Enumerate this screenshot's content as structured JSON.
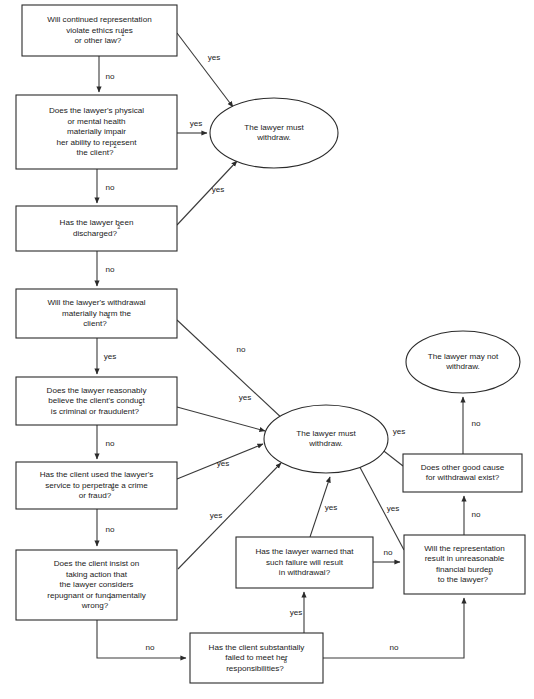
{
  "diagram": {
    "colors": {
      "background": "#ffffff",
      "stroke": "#2b2b2b",
      "edge": "#3a3a3a",
      "text": "#1a1a1a"
    },
    "nodes": [
      {
        "id": "q1",
        "shape": "rect",
        "x": 22,
        "y": 5,
        "w": 155,
        "h": 51,
        "lines": [
          "Will continued representation",
          "violate ethics rules",
          "or other law?"
        ],
        "superscript": "1"
      },
      {
        "id": "q2",
        "shape": "rect",
        "x": 16,
        "y": 95,
        "w": 161,
        "h": 74,
        "lines": [
          "Does the lawyer's physical",
          "or mental health",
          "materially impair",
          "her ability to represent",
          "the client?"
        ],
        "superscript": "2"
      },
      {
        "id": "q3",
        "shape": "rect",
        "x": 16,
        "y": 206,
        "w": 161,
        "h": 45,
        "lines": [
          "Has the lawyer been",
          "discharged?"
        ],
        "superscript": "3"
      },
      {
        "id": "q4",
        "shape": "rect",
        "x": 16,
        "y": 289,
        "w": 161,
        "h": 49,
        "lines": [
          "Will the lawyer's withdrawal",
          "materially harm the",
          "client?"
        ],
        "superscript": "4"
      },
      {
        "id": "q5",
        "shape": "rect",
        "x": 16,
        "y": 377,
        "w": 161,
        "h": 48,
        "lines": [
          "Does the lawyer reasonably",
          "believe the client's conduct",
          "is criminal or fraudulent?"
        ],
        "superscript": "5"
      },
      {
        "id": "q6",
        "shape": "rect",
        "x": 16,
        "y": 462,
        "w": 161,
        "h": 47,
        "lines": [
          "Has the client used the lawyer's",
          "service to perpetrate a crime",
          "or fraud?"
        ],
        "superscript": "6"
      },
      {
        "id": "q7",
        "shape": "rect",
        "x": 16,
        "y": 550,
        "w": 161,
        "h": 70,
        "lines": [
          "Does the client insist on",
          "taking action that",
          "the lawyer considers",
          "repugnant or fundamentally",
          "wrong?"
        ],
        "superscript": "7"
      },
      {
        "id": "q8",
        "shape": "rect",
        "x": 190,
        "y": 633,
        "w": 133,
        "h": 50,
        "lines": [
          "Has the client substantially",
          "failed to meet her",
          "responsibilities?"
        ],
        "superscript": "8"
      },
      {
        "id": "q9",
        "shape": "rect",
        "x": 236,
        "y": 537,
        "w": 137,
        "h": 51,
        "lines": [
          "Has the lawyer warned that",
          "such failure will result",
          "in withdrawal?"
        ],
        "superscript": ""
      },
      {
        "id": "q10",
        "shape": "rect",
        "x": 404,
        "y": 535,
        "w": 121,
        "h": 59,
        "lines": [
          "Will the representation",
          "result in unreasonable",
          "financial burden",
          "to the lawyer?"
        ],
        "superscript": "9"
      },
      {
        "id": "q11",
        "shape": "rect",
        "x": 403,
        "y": 454,
        "w": 119,
        "h": 38,
        "lines": [
          "Does other good cause",
          "for withdrawal exist?"
        ],
        "superscript": ""
      },
      {
        "id": "must1",
        "shape": "ellipse",
        "cx": 274,
        "cy": 133,
        "rx": 64,
        "ry": 35,
        "lines": [
          "The lawyer must",
          "withdraw."
        ],
        "superscript": ""
      },
      {
        "id": "must2",
        "shape": "ellipse",
        "cx": 326,
        "cy": 439,
        "rx": 62,
        "ry": 34,
        "lines": [
          "The lawyer must",
          "withdraw."
        ],
        "superscript": ""
      },
      {
        "id": "maynot",
        "shape": "ellipse",
        "cx": 463,
        "cy": 362,
        "rx": 57,
        "ry": 31,
        "lines": [
          "The lawyer may not",
          "withdraw."
        ],
        "superscript": ""
      }
    ],
    "edges": [
      {
        "id": "e-q1-yes",
        "label": "yes",
        "label_x": 214,
        "label_y": 58,
        "path": "M 177 33 L 233 107",
        "arrow": true
      },
      {
        "id": "e-q1-no",
        "label": "no",
        "label_x": 110,
        "label_y": 77,
        "path": "M 99 56 L 99 92",
        "arrow": true
      },
      {
        "id": "e-q2-yes",
        "label": "yes",
        "label_x": 196,
        "label_y": 124,
        "path": "M 177 133 L 207 133",
        "arrow": true
      },
      {
        "id": "e-q2-no",
        "label": "no",
        "label_x": 110,
        "label_y": 188,
        "path": "M 97 169 L 97 203",
        "arrow": true
      },
      {
        "id": "e-q3-yes",
        "label": "yes",
        "label_x": 218,
        "label_y": 190,
        "path": "M 177 225 L 237 161",
        "arrow": true
      },
      {
        "id": "e-q3-no",
        "label": "no",
        "label_x": 110,
        "label_y": 270,
        "path": "M 97 251 L 97 286",
        "arrow": true
      },
      {
        "id": "e-q4-no",
        "label": "no",
        "label_x": 241,
        "label_y": 350,
        "path": "M 177 320 L 285 421",
        "arrow": true
      },
      {
        "id": "e-q4-yes",
        "label": "yes",
        "label_x": 110,
        "label_y": 357,
        "path": "M 97 338 L 97 374",
        "arrow": true
      },
      {
        "id": "e-q5-yes",
        "label": "yes",
        "label_x": 245,
        "label_y": 398,
        "path": "M 177 407 L 265 431",
        "arrow": true
      },
      {
        "id": "e-q5-no",
        "label": "no",
        "label_x": 110,
        "label_y": 444,
        "path": "M 97 425 L 97 459",
        "arrow": true
      },
      {
        "id": "e-q6-yes",
        "label": "yes",
        "label_x": 223,
        "label_y": 464,
        "path": "M 177 479 L 263 444",
        "arrow": true
      },
      {
        "id": "e-q6-no",
        "label": "no",
        "label_x": 110,
        "label_y": 530,
        "path": "M 97 509 L 97 546",
        "arrow": true
      },
      {
        "id": "e-q7-yes",
        "label": "yes",
        "label_x": 216,
        "label_y": 516,
        "path": "M 178 569 L 281 463",
        "arrow": true
      },
      {
        "id": "e-q7-no",
        "label": "no",
        "label_x": 150,
        "label_y": 648,
        "path": "M 97 620 L 97 658 L 186 658",
        "arrow": true
      },
      {
        "id": "e-q8-yes",
        "label": "yes",
        "label_x": 296,
        "label_y": 613,
        "path": "M 304 633 L 304 592",
        "arrow": true
      },
      {
        "id": "e-q8-no",
        "label": "no",
        "label_x": 394,
        "label_y": 648,
        "path": "M 323 658 L 464 658 L 464 598",
        "arrow": true
      },
      {
        "id": "e-q9-yes",
        "label": "yes",
        "label_x": 331,
        "label_y": 508,
        "path": "M 310 537 L 330 477",
        "arrow": true
      },
      {
        "id": "e-q9-no",
        "label": "no",
        "label_x": 388,
        "label_y": 553,
        "path": "M 373 562 L 400 562",
        "arrow": true
      },
      {
        "id": "e-q10-yes",
        "label": "yes",
        "label_x": 393,
        "label_y": 509,
        "path": "M 404 550 L 355 458",
        "arrow": true
      },
      {
        "id": "e-q10-no",
        "label": "no",
        "label_x": 476,
        "label_y": 515,
        "path": "M 464 535 L 464 496",
        "arrow": true
      },
      {
        "id": "e-q11-yes",
        "label": "yes",
        "label_x": 399,
        "label_y": 432,
        "path": "M 403 466 L 371 441",
        "arrow": true
      },
      {
        "id": "e-q11-no",
        "label": "no",
        "label_x": 476,
        "label_y": 424,
        "path": "M 463 454 L 463 397",
        "arrow": true
      }
    ]
  }
}
